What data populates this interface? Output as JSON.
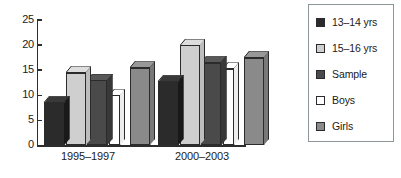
{
  "chart_data": {
    "type": "bar",
    "title": "",
    "subtitle": "",
    "xlabel": "",
    "ylabel": "",
    "categories": [
      "1995–1997",
      "2000–2003"
    ],
    "ylim": [
      0,
      25
    ],
    "yticks": [
      0,
      5,
      10,
      15,
      20,
      25
    ],
    "ytick_labels": [
      "0",
      "5",
      "10",
      "15",
      "20",
      "25"
    ],
    "grid": false,
    "legend_position": "right",
    "style": "3d-grouped-bars-grayscale",
    "series": [
      {
        "name": "13–14 yrs",
        "color": "#2b2b2b",
        "values": [
          8.5,
          12.7
        ]
      },
      {
        "name": "15–16 yrs",
        "color": "#cfcfcf",
        "values": [
          14.5,
          20.0
        ]
      },
      {
        "name": "Sample",
        "color": "#4a4a4a",
        "values": [
          13.0,
          16.5
        ]
      },
      {
        "name": "Boys",
        "color": "#ffffff",
        "values": [
          10.0,
          15.3
        ]
      },
      {
        "name": "Girls",
        "color": "#8a8a8a",
        "values": [
          15.5,
          17.5
        ]
      }
    ]
  },
  "legend": {
    "items": [
      {
        "label": "13–14 yrs",
        "color": "#2b2b2b"
      },
      {
        "label": "15–16 yrs",
        "color": "#cfcfcf"
      },
      {
        "label": "Sample",
        "color": "#4a4a4a"
      },
      {
        "label": "Boys",
        "color": "#ffffff"
      },
      {
        "label": "Girls",
        "color": "#8a8a8a"
      }
    ],
    "border_color": "#8d9699"
  },
  "axis": {
    "line_color": "#2d2d2d",
    "ytick_labels": [
      "25",
      "20",
      "15",
      "10",
      "5",
      "0"
    ],
    "xtick_labels": [
      "1995–1997",
      "2000–2003"
    ]
  }
}
